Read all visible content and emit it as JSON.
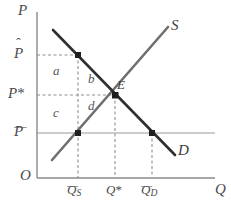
{
  "figure": {
    "kind": "supply-demand-diagram",
    "background": "#ffffff"
  },
  "axes": {
    "origin_label": "O",
    "y_axis_label": "P",
    "x_axis_label": "Q",
    "axis_color": "#8a8a8a",
    "x_axis": {
      "x_start": 37,
      "x_end": 215,
      "y": 178
    },
    "y_axis": {
      "y_start": 12,
      "y_end": 178,
      "x": 37
    }
  },
  "price_levels": [
    {
      "key": "p_hat",
      "label_base": "P",
      "accent": "hat",
      "y": 55,
      "guide": "dashed",
      "guide_to_x": 78
    },
    {
      "key": "p_star",
      "label_base": "P",
      "accent": "star",
      "y": 95,
      "guide": "dashed",
      "guide_to_x": 115
    },
    {
      "key": "p_bar",
      "label_base": "P",
      "accent": "bar",
      "y": 133,
      "guide": "solid",
      "guide_to_x": 215
    }
  ],
  "quantities": [
    {
      "key": "q_s",
      "label_base": "Q",
      "accent": "bar",
      "subscript": "S",
      "x": 78
    },
    {
      "key": "q_star",
      "label_base": "Q",
      "accent": "star",
      "subscript": "",
      "x": 115
    },
    {
      "key": "q_d",
      "label_base": "Q",
      "accent": "bar",
      "subscript": "D",
      "x": 152
    }
  ],
  "curves": [
    {
      "key": "demand",
      "label": "D",
      "color": "#2f2f2f",
      "width": 2.6,
      "from": {
        "x": 53,
        "y": 30
      },
      "to": {
        "x": 175,
        "y": 155
      },
      "label_pos": {
        "x": 178,
        "y": 150
      }
    },
    {
      "key": "supply",
      "label": "S",
      "color": "#6f6f6f",
      "width": 2.6,
      "from": {
        "x": 52,
        "y": 160
      },
      "to": {
        "x": 168,
        "y": 27
      },
      "label_pos": {
        "x": 171,
        "y": 25
      }
    }
  ],
  "points": [
    {
      "key": "p-hat-on-demand",
      "x": 78,
      "y": 55,
      "label": ""
    },
    {
      "key": "equilibrium",
      "x": 115,
      "y": 95,
      "label": "E"
    },
    {
      "key": "p-bar-on-supply",
      "x": 78,
      "y": 133,
      "label": ""
    },
    {
      "key": "p-bar-on-demand",
      "x": 152,
      "y": 133,
      "label": ""
    }
  ],
  "equilibrium_label": "E",
  "regions": [
    {
      "key": "a",
      "label": "a",
      "x": 53,
      "y": 70
    },
    {
      "key": "b",
      "label": "b",
      "x": 88,
      "y": 78
    },
    {
      "key": "c",
      "label": "c",
      "x": 53,
      "y": 112
    },
    {
      "key": "d",
      "label": "d",
      "x": 88,
      "y": 105
    }
  ],
  "guides": {
    "dashed_color": "#909090",
    "solid_color": "#999999",
    "dash_pattern": "3,2.5"
  },
  "drop_lines": [
    {
      "key": "q_s_drop",
      "x": 78,
      "y_top": 55,
      "y_bottom": 178
    },
    {
      "key": "q_star_drop",
      "x": 115,
      "y_top": 95,
      "y_bottom": 178
    },
    {
      "key": "q_d_drop",
      "x": 152,
      "y_top": 133,
      "y_bottom": 178
    }
  ]
}
